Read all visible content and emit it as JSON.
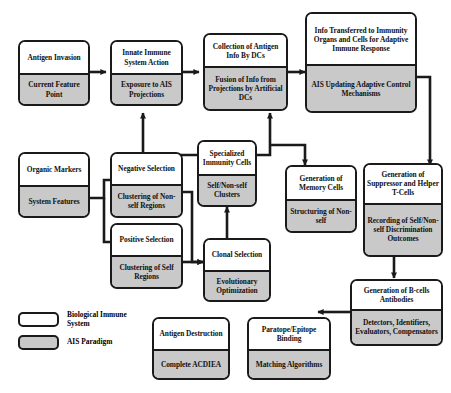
{
  "figure": {
    "caption": ""
  },
  "legend": {
    "items": [
      {
        "swatch": "white-rounded-box",
        "label": "Biological Immune System",
        "color": "#ffffff"
      },
      {
        "swatch": "gray-rounded-box",
        "label": "AIS Paradigm",
        "color": "#c9c9c9"
      }
    ]
  },
  "nodes": [
    {
      "id": "antigen_invasion",
      "bio": "Antigen Invasion",
      "ais": "Current Feature Point"
    },
    {
      "id": "innate_immune",
      "bio": "Innate Immune System Action",
      "ais": "Exposure to AIS Projections"
    },
    {
      "id": "collection_antigen",
      "bio": "Collection of Antigen Info By DCs",
      "ais": "Fusion of Info from Projections by Artificial DCs"
    },
    {
      "id": "info_transferred",
      "bio": "Info Transferred to Immunity Organs and Cells for Adaptive Immune Response",
      "ais": "AIS Updating Adaptive Control Mechanisms"
    },
    {
      "id": "organic_markers",
      "bio": "Organic Markers",
      "ais": "System Features"
    },
    {
      "id": "negative_selection",
      "bio": "Negative Selection",
      "ais": "Clustering of Non-self Regions"
    },
    {
      "id": "positive_selection",
      "bio": "Positive Selection",
      "ais": "Clustering of Self Regions"
    },
    {
      "id": "specialized_cells",
      "bio": "Specialized Immunity Cells",
      "ais": "Self/Non-self Clusters"
    },
    {
      "id": "clonal_selection",
      "bio": "Clonal Selection",
      "ais": "Evolutionary Optimization"
    },
    {
      "id": "memory_cells",
      "bio": "Generation of Memory Cells",
      "ais": "Structuring of Non-self"
    },
    {
      "id": "suppressor_helper",
      "bio": "Generation of Suppressor and Helper T-Cells",
      "ais": "Recording of Self/Non-self Discrimination Outcomes"
    },
    {
      "id": "bcells_antibodies",
      "bio": "Generation of B-cells Antibodies",
      "ais": "Detectors, Identifiers, Evaluators, Compensators"
    },
    {
      "id": "paratope_epitope",
      "bio": "Paratope/Epitope Binding",
      "ais": "Matching Algorithms"
    },
    {
      "id": "antigen_destruction",
      "bio": "Antigen Destruction",
      "ais": "Complete ACDIEA"
    }
  ],
  "flow": [
    {
      "from": "antigen_invasion",
      "to": "innate_immune"
    },
    {
      "from": "innate_immune",
      "to": "collection_antigen"
    },
    {
      "from": "collection_antigen",
      "to": "info_transferred"
    },
    {
      "from": "specialized_cells",
      "to": "innate_immune"
    },
    {
      "from": "specialized_cells",
      "to": "info_transferred"
    },
    {
      "from": "specialized_cells",
      "to": "memory_cells"
    },
    {
      "from": "info_transferred",
      "to": "suppressor_helper"
    },
    {
      "from": "organic_markers",
      "to": "negative_selection"
    },
    {
      "from": "organic_markers",
      "to": "positive_selection"
    },
    {
      "from": "negative_selection",
      "to": "clonal_selection"
    },
    {
      "from": "positive_selection",
      "to": "clonal_selection"
    },
    {
      "from": "clonal_selection",
      "to": "specialized_cells"
    },
    {
      "from": "suppressor_helper",
      "to": "bcells_antibodies"
    },
    {
      "from": "bcells_antibodies",
      "to": "paratope_epitope"
    },
    {
      "from": "paratope_epitope",
      "to": "antigen_destruction"
    }
  ],
  "colors": {
    "bio_fill": "#ffffff",
    "ais_fill": "#c9c9c9",
    "stroke": "#1a1a1a",
    "background": "#ffffff"
  }
}
